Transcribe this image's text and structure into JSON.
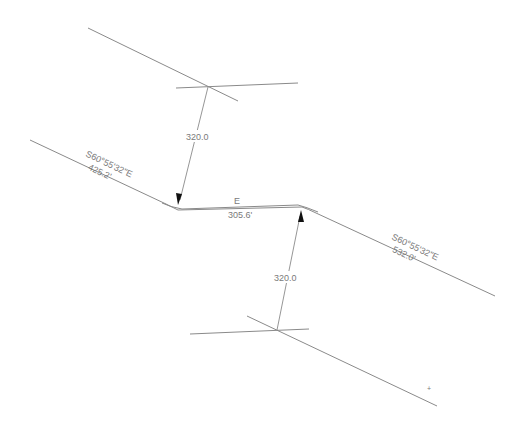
{
  "drawing": {
    "type": "road-alignment-offset",
    "segments": [
      {
        "id": "left-tangent",
        "bearing": "S60°55'32\"E",
        "length": "425.2'"
      },
      {
        "id": "middle-tangent",
        "bearing": "E",
        "length": "305.6'"
      },
      {
        "id": "right-tangent",
        "bearing": "S60°55'32\"E",
        "length": "532.0'"
      }
    ],
    "offsets": [
      {
        "id": "top-offset",
        "value": "320.0"
      },
      {
        "id": "bottom-offset",
        "value": "320.0"
      }
    ],
    "marker": "+",
    "colors": {
      "line": "#8a8a8a",
      "text": "#7a7a7a",
      "arrow": "#111111",
      "background": "#ffffff"
    }
  }
}
